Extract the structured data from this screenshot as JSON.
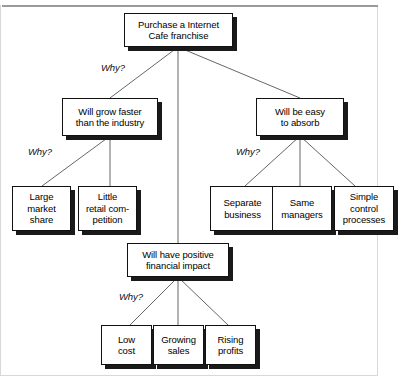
{
  "diagram": {
    "type": "why-tree",
    "nodes": {
      "root": {
        "label": "Purchase a Internet\nCafe franchise"
      },
      "branch_left": {
        "label": "Will grow faster\nthan the industry"
      },
      "branch_middle": {
        "label": "Will have positive\nfinancial impact"
      },
      "branch_right": {
        "label": "Will be easy\nto absorb"
      },
      "leaf_large_market_share": {
        "label": "Large\nmarket\nshare"
      },
      "leaf_little_retail_competition": {
        "label": "Little\nretail com-\npetition"
      },
      "leaf_separate_business": {
        "label": "Separate\nbusiness"
      },
      "leaf_same_managers": {
        "label": "Same\nmanagers"
      },
      "leaf_simple_control_processes": {
        "label": "Simple\ncontrol\nprocesses"
      },
      "leaf_low_cost": {
        "label": "Low\ncost"
      },
      "leaf_growing_sales": {
        "label": "Growing\nsales"
      },
      "leaf_rising_profits": {
        "label": "Rising\nprofits"
      }
    },
    "edge_labels": {
      "root_fork": "Why?",
      "left_fork": "Why?",
      "right_fork": "Why?",
      "middle_fork": "Why?"
    },
    "colors": {
      "node_fill": "#ffffff",
      "node_border": "#111111",
      "node_shadow": "#1a1a1a",
      "connector": "#555555",
      "text": "#000000",
      "frame": "#d8d8d8",
      "rule": "#9a9a9a"
    }
  }
}
